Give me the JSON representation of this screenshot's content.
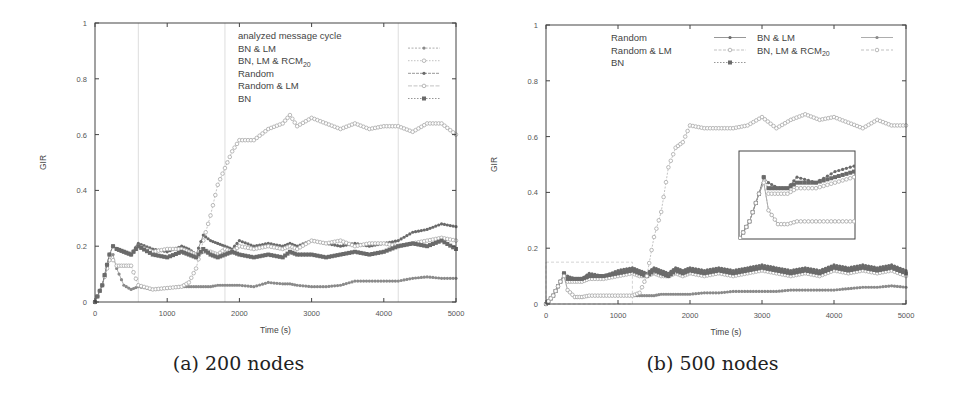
{
  "chart_data": [
    {
      "type": "line",
      "panel": "a",
      "caption": "(a) 200 nodes",
      "xlabel": "Time (s)",
      "ylabel": "GIR",
      "xlim": [
        0,
        5000
      ],
      "ylim": [
        0,
        1
      ],
      "xticks": [
        "0",
        "1000",
        "2000",
        "3000",
        "4000",
        "5000"
      ],
      "yticks": [
        "0",
        "0.2",
        "0.4",
        "0.6",
        "0.8",
        "1"
      ],
      "grid": false,
      "legend_position": "top-right",
      "legend": [
        "analyzed message cycle",
        "BN & LM",
        "BN, LM & RCM20",
        "Random",
        "Random & LM",
        "BN"
      ],
      "annotations": [
        {
          "type": "vertical-lines",
          "label": "analyzed message cycle",
          "x": [
            600,
            1800,
            4200
          ]
        }
      ],
      "x": [
        0,
        100,
        200,
        250,
        300,
        400,
        500,
        600,
        800,
        1000,
        1200,
        1300,
        1400,
        1500,
        1600,
        1700,
        1800,
        1900,
        2000,
        2200,
        2400,
        2600,
        2700,
        2800,
        3000,
        3200,
        3400,
        3600,
        3800,
        4000,
        4200,
        4400,
        4600,
        4800,
        5000
      ],
      "series": [
        {
          "name": "BN & LM",
          "marker": "filled-circle",
          "values": [
            0.0,
            0.06,
            0.15,
            0.17,
            0.12,
            0.06,
            0.045,
            0.055,
            0.045,
            0.05,
            0.055,
            0.055,
            0.055,
            0.055,
            0.055,
            0.06,
            0.06,
            0.06,
            0.06,
            0.055,
            0.07,
            0.065,
            0.065,
            0.06,
            0.055,
            0.055,
            0.06,
            0.075,
            0.075,
            0.075,
            0.075,
            0.085,
            0.09,
            0.085,
            0.085
          ]
        },
        {
          "name": "BN, LM & RCM20",
          "marker": "open-circle",
          "values": [
            0.0,
            0.06,
            0.15,
            0.15,
            0.13,
            0.13,
            0.13,
            0.06,
            0.045,
            0.05,
            0.055,
            0.07,
            0.12,
            0.22,
            0.31,
            0.42,
            0.48,
            0.54,
            0.58,
            0.58,
            0.62,
            0.64,
            0.67,
            0.63,
            0.66,
            0.64,
            0.62,
            0.64,
            0.62,
            0.63,
            0.63,
            0.61,
            0.64,
            0.64,
            0.6
          ]
        },
        {
          "name": "Random",
          "marker": "filled-circle",
          "values": [
            0.0,
            0.06,
            0.17,
            0.2,
            0.19,
            0.18,
            0.17,
            0.21,
            0.19,
            0.18,
            0.2,
            0.19,
            0.17,
            0.24,
            0.22,
            0.21,
            0.2,
            0.19,
            0.22,
            0.2,
            0.21,
            0.2,
            0.21,
            0.2,
            0.22,
            0.21,
            0.2,
            0.21,
            0.2,
            0.21,
            0.22,
            0.25,
            0.26,
            0.28,
            0.27
          ]
        },
        {
          "name": "Random & LM",
          "marker": "open-circle",
          "values": [
            0.0,
            0.06,
            0.17,
            0.2,
            0.19,
            0.18,
            0.17,
            0.2,
            0.18,
            0.19,
            0.19,
            0.18,
            0.17,
            0.18,
            0.18,
            0.17,
            0.19,
            0.18,
            0.2,
            0.19,
            0.2,
            0.19,
            0.2,
            0.19,
            0.22,
            0.21,
            0.22,
            0.2,
            0.21,
            0.21,
            0.2,
            0.21,
            0.22,
            0.23,
            0.22
          ]
        },
        {
          "name": "BN",
          "marker": "filled-square",
          "values": [
            0.0,
            0.06,
            0.17,
            0.2,
            0.19,
            0.18,
            0.17,
            0.2,
            0.17,
            0.16,
            0.18,
            0.17,
            0.16,
            0.19,
            0.17,
            0.16,
            0.17,
            0.18,
            0.17,
            0.16,
            0.17,
            0.16,
            0.18,
            0.17,
            0.17,
            0.16,
            0.17,
            0.18,
            0.17,
            0.18,
            0.2,
            0.21,
            0.2,
            0.22,
            0.19
          ]
        }
      ]
    },
    {
      "type": "line",
      "panel": "b",
      "caption": "(b) 500 nodes",
      "xlabel": "Time (s)",
      "ylabel": "GIR",
      "xlim": [
        0,
        5000
      ],
      "ylim": [
        0,
        1
      ],
      "xticks": [
        "0",
        "1000",
        "2000",
        "3000",
        "4000",
        "5000"
      ],
      "yticks": [
        "0",
        "0.2",
        "0.4",
        "0.6",
        "0.8",
        "1"
      ],
      "grid": false,
      "legend_position": "top (two columns)",
      "legend": [
        "Random",
        "Random & LM",
        "BN",
        "BN & LM",
        "BN, LM & RCM20"
      ],
      "annotations": [
        {
          "type": "zoom-box",
          "x": [
            0,
            1200
          ],
          "y": [
            0,
            0.15
          ]
        },
        {
          "type": "inset",
          "description": "magnified view of 0–1200 s, 0–0.15 GIR"
        }
      ],
      "x": [
        0,
        100,
        200,
        250,
        300,
        400,
        500,
        600,
        800,
        1000,
        1200,
        1300,
        1400,
        1500,
        1600,
        1700,
        1800,
        1900,
        2000,
        2200,
        2400,
        2600,
        2800,
        3000,
        3200,
        3400,
        3600,
        3800,
        4000,
        4200,
        4400,
        4600,
        4800,
        5000
      ],
      "series": [
        {
          "name": "Random",
          "marker": "filled-circle",
          "values": [
            0.0,
            0.03,
            0.08,
            0.11,
            0.1,
            0.09,
            0.09,
            0.11,
            0.1,
            0.12,
            0.13,
            0.12,
            0.11,
            0.13,
            0.12,
            0.11,
            0.13,
            0.12,
            0.13,
            0.12,
            0.13,
            0.12,
            0.13,
            0.14,
            0.13,
            0.12,
            0.13,
            0.12,
            0.14,
            0.13,
            0.14,
            0.13,
            0.14,
            0.12
          ]
        },
        {
          "name": "Random & LM",
          "marker": "open-circle",
          "values": [
            0.0,
            0.03,
            0.08,
            0.11,
            0.08,
            0.08,
            0.08,
            0.09,
            0.09,
            0.1,
            0.11,
            0.1,
            0.1,
            0.11,
            0.1,
            0.1,
            0.11,
            0.1,
            0.11,
            0.1,
            0.11,
            0.1,
            0.11,
            0.12,
            0.11,
            0.1,
            0.11,
            0.1,
            0.12,
            0.11,
            0.12,
            0.11,
            0.12,
            0.1
          ]
        },
        {
          "name": "BN",
          "marker": "filled-square",
          "values": [
            0.0,
            0.03,
            0.08,
            0.11,
            0.09,
            0.09,
            0.09,
            0.1,
            0.1,
            0.11,
            0.12,
            0.11,
            0.1,
            0.12,
            0.11,
            0.1,
            0.12,
            0.11,
            0.12,
            0.11,
            0.12,
            0.11,
            0.12,
            0.13,
            0.12,
            0.11,
            0.12,
            0.11,
            0.13,
            0.12,
            0.13,
            0.12,
            0.13,
            0.11
          ]
        },
        {
          "name": "BN & LM",
          "marker": "filled-circle",
          "values": [
            0.0,
            0.03,
            0.08,
            0.1,
            0.05,
            0.025,
            0.025,
            0.03,
            0.03,
            0.03,
            0.03,
            0.03,
            0.03,
            0.03,
            0.035,
            0.035,
            0.035,
            0.035,
            0.035,
            0.04,
            0.04,
            0.045,
            0.045,
            0.045,
            0.045,
            0.05,
            0.05,
            0.05,
            0.05,
            0.055,
            0.06,
            0.06,
            0.065,
            0.06
          ]
        },
        {
          "name": "BN, LM & RCM20",
          "marker": "open-circle",
          "values": [
            0.0,
            0.03,
            0.08,
            0.1,
            0.05,
            0.025,
            0.025,
            0.03,
            0.03,
            0.03,
            0.03,
            0.04,
            0.1,
            0.24,
            0.33,
            0.49,
            0.56,
            0.58,
            0.64,
            0.63,
            0.63,
            0.63,
            0.64,
            0.67,
            0.63,
            0.66,
            0.68,
            0.66,
            0.67,
            0.65,
            0.63,
            0.66,
            0.64,
            0.64
          ]
        }
      ]
    }
  ],
  "panels": {
    "a": {
      "caption": "(a) 200 nodes",
      "xlabel": "Time (s)",
      "ylabel": "GIR",
      "legend": {
        "title": "analyzed message cycle",
        "items": [
          "BN & LM",
          "BN, LM & RCM",
          "Random",
          "Random & LM",
          "BN"
        ],
        "subscript": "20"
      }
    },
    "b": {
      "caption": "(b) 500 nodes",
      "xlabel": "Time (s)",
      "ylabel": "GIR",
      "legend": {
        "col1": [
          "Random",
          "Random & LM",
          "BN"
        ],
        "col2": [
          "BN & LM",
          "BN, LM & RCM"
        ],
        "subscript": "20"
      }
    }
  },
  "ticks": {
    "x": [
      "0",
      "1000",
      "2000",
      "3000",
      "4000",
      "5000"
    ],
    "y": [
      "0",
      "0.2",
      "0.4",
      "0.6",
      "0.8",
      "1"
    ]
  },
  "colors": {
    "frame": "#444444",
    "series_dark": "#6a6a6a",
    "series_mid": "#8a8a8a",
    "series_light": "#a8a8a8",
    "cycle_lines": "#dddddd"
  }
}
